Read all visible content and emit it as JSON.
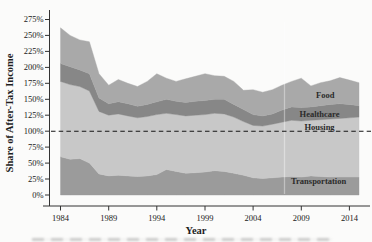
{
  "figure": {
    "background": "#fbfbfa"
  },
  "chart_data": {
    "type": "area",
    "stacked": true,
    "title": "",
    "xlabel": "Year",
    "ylabel": "Share of After-Tax Income",
    "x_domain": [
      1984,
      2015
    ],
    "ylim": [
      0,
      275
    ],
    "grid": false,
    "legend": "in-plot area labels",
    "x": [
      1984,
      1985,
      1986,
      1987,
      1988,
      1989,
      1990,
      1991,
      1992,
      1993,
      1994,
      1995,
      1996,
      1997,
      1998,
      1999,
      2000,
      2001,
      2002,
      2003,
      2004,
      2005,
      2006,
      2007,
      2008,
      2009,
      2010,
      2011,
      2012,
      2013,
      2014,
      2015
    ],
    "series": [
      {
        "name": "Transportation",
        "color": "#9b9b9b",
        "values": [
          60,
          56,
          57,
          50,
          33,
          30,
          31,
          30,
          29,
          30,
          32,
          40,
          37,
          34,
          35,
          36,
          38,
          37,
          34,
          31,
          27,
          26,
          27,
          28,
          29,
          28,
          30,
          29,
          28,
          28,
          28,
          28
        ]
      },
      {
        "name": "Housing",
        "color": "#c8c8c8",
        "values": [
          118,
          117,
          113,
          113,
          98,
          95,
          96,
          94,
          92,
          93,
          94,
          88,
          89,
          90,
          90,
          90,
          90,
          90,
          88,
          84,
          82,
          82,
          84,
          86,
          88,
          88,
          87,
          89,
          91,
          92,
          93,
          94
        ]
      },
      {
        "name": "Healthcare",
        "color": "#878787",
        "values": [
          28,
          28,
          26,
          27,
          21,
          18,
          19,
          19,
          18,
          19,
          20,
          22,
          21,
          21,
          22,
          22,
          22,
          23,
          20,
          19,
          17,
          16,
          16,
          19,
          21,
          21,
          21,
          22,
          23,
          23,
          21,
          18
        ]
      },
      {
        "name": "Food",
        "color": "#a9a9a9",
        "values": [
          56,
          49,
          47,
          50,
          38,
          29,
          35,
          32,
          31,
          36,
          44,
          33,
          31,
          37,
          39,
          42,
          37,
          36,
          36,
          30,
          39,
          37,
          38,
          39,
          40,
          46,
          33,
          36,
          37,
          41,
          38,
          36
        ]
      }
    ],
    "y_ticks": {
      "values": [
        0,
        25,
        50,
        75,
        100,
        125,
        150,
        175,
        200,
        225,
        250,
        275
      ],
      "labels": [
        "0%",
        "25%",
        "50%",
        "75%",
        "100%",
        "125%",
        "150%",
        "175%",
        "200%",
        "225%",
        "250%",
        "275%"
      ]
    },
    "x_ticks": {
      "values": [
        1984,
        1989,
        1994,
        1999,
        2004,
        2009,
        2014
      ],
      "labels": [
        "1984",
        "1989",
        "1994",
        "1999",
        "2004",
        "2009",
        "2014"
      ]
    },
    "reference_line": {
      "value": 100,
      "style": "dashed",
      "color": "#151515"
    },
    "annotations": [
      {
        "text": "Food",
        "year": 2011.5,
        "pct": 157
      },
      {
        "text": "Healthcare",
        "year": 2010.9,
        "pct": 127
      },
      {
        "text": "Housing",
        "year": 2010.9,
        "pct": 106.5
      },
      {
        "text": "Transportation",
        "year": 2010.8,
        "pct": 22
      }
    ]
  }
}
